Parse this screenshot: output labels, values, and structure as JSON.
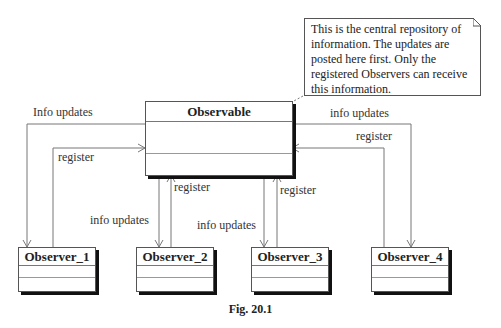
{
  "note": {
    "text": "This is the central repository of information. The updates are posted here first. Only the registered Observers can receive this information."
  },
  "observable": {
    "name": "Observable"
  },
  "observers": [
    {
      "name": "Observer_1"
    },
    {
      "name": "Observer_2"
    },
    {
      "name": "Observer_3"
    },
    {
      "name": "Observer_4"
    }
  ],
  "labels": {
    "left_info": "Info updates",
    "left_register": "register",
    "o2_register": "register",
    "o2_info": "info updates",
    "o3_register": "register",
    "o3_info": "info updates",
    "right_info": "info updates",
    "right_register": "register"
  },
  "caption": "Fig. 20.1"
}
